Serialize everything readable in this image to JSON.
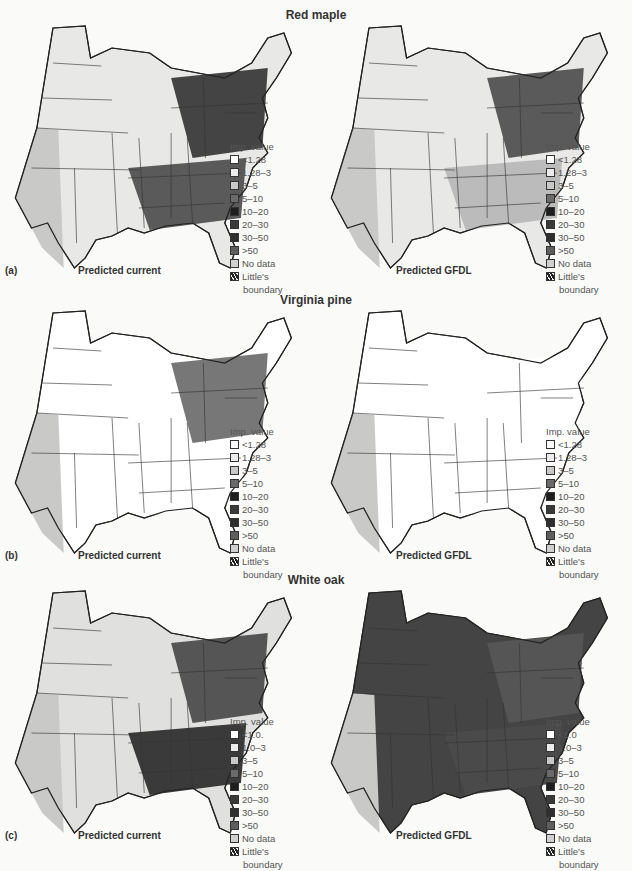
{
  "figure": {
    "rows": [
      {
        "id": "a",
        "species": "Red maple",
        "panel_letter": "(a)",
        "panels": [
          {
            "caption": "Predicted current",
            "fill": [
              "#e8e8e6",
              "#c9c9c7",
              "#5a5a5a",
              "#444"
            ]
          },
          {
            "caption": "Predicted GFDL",
            "fill": [
              "#e8e8e6",
              "#c9c9c7",
              "#bbb",
              "#5a5a5a"
            ]
          }
        ],
        "legend": {
          "title": "Imp. value",
          "items": [
            "<1.28",
            "1.28–3",
            "3–5",
            "5–10",
            "10–20",
            "20–30",
            "30–50",
            ">50",
            "No data",
            "Little's"
          ],
          "last_line": "boundary"
        }
      },
      {
        "id": "b",
        "species": "Virginia pine",
        "panel_letter": "(b)",
        "panels": [
          {
            "caption": "Predicted current",
            "fill": [
              "#fff",
              "#c9c9c7",
              "#fff",
              "#777"
            ]
          },
          {
            "caption": "Predicted GFDL",
            "fill": [
              "#fff",
              "#c9c9c7",
              "#fff",
              "#fff"
            ]
          }
        ],
        "legend": {
          "title": "Imp. value",
          "items": [
            "<1.28",
            "1.28–3",
            "3–5",
            "5–10",
            "10–20",
            "20–30",
            "30–50",
            ">50",
            "No data",
            "Little's"
          ],
          "last_line": "boundary"
        }
      },
      {
        "id": "c",
        "species": "White oak",
        "panel_letter": "(c)",
        "panels": [
          {
            "caption": "Predicted current",
            "fill": [
              "#e0e0de",
              "#c9c9c7",
              "#3a3a3a",
              "#555"
            ]
          },
          {
            "caption": "Predicted GFDL",
            "fill": [
              "#444",
              "#c9c9c7",
              "#4a4a4a",
              "#555"
            ]
          }
        ],
        "legend": {
          "title": "Imp. value",
          "items": [
            "<1.0.",
            "1.0–3",
            "3–5",
            "5–10",
            "10–20",
            "20–30",
            "30–50",
            ">50",
            "No data",
            "Little's"
          ],
          "items_right": [
            "<1.0",
            "1.0–3",
            "3–5",
            "5–10",
            "10–20",
            "20–30",
            "30–50",
            ">50",
            "No data",
            "Little's"
          ],
          "last_line": "boundary"
        }
      }
    ],
    "legend_colors": [
      "#ffffff",
      "#ececec",
      "#c8c8c8",
      "#6a6a6a",
      "#1e1e1e",
      "#3a3a3a",
      "#2e2e2e",
      "#5e5e5e",
      "#d0d0d0",
      "hatch"
    ]
  }
}
